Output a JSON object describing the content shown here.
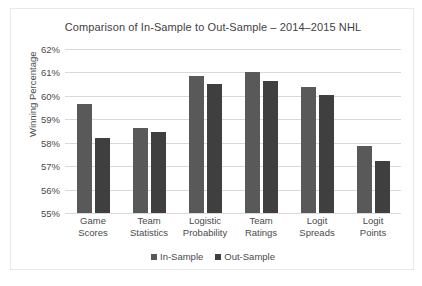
{
  "chart_data": {
    "type": "bar",
    "title": "Comparison of In-Sample to Out-Sample – 2014–2015 NHL",
    "xlabel": "",
    "ylabel": "Winning Percentage",
    "ylim": [
      55,
      62
    ],
    "ytick_values": [
      62,
      61,
      60,
      59,
      58,
      57,
      56,
      55
    ],
    "ytick_labels": [
      "62%",
      "61%",
      "60%",
      "59%",
      "58%",
      "57%",
      "56%",
      "55%"
    ],
    "grid": true,
    "legend_position": "bottom",
    "categories": [
      "Game Scores",
      "Team Statistics",
      "Logistic Probability",
      "Team Ratings",
      "Logit Spreads",
      "Logit Points"
    ],
    "category_lines": [
      [
        "Game",
        "Scores"
      ],
      [
        "Team",
        "Statistics"
      ],
      [
        "Logistic",
        "Probability"
      ],
      [
        "Team",
        "Ratings"
      ],
      [
        "Logit",
        "Spreads"
      ],
      [
        "Logit",
        "Points"
      ]
    ],
    "series": [
      {
        "name": "In-Sample",
        "color": "#595959",
        "values": [
          59.65,
          58.65,
          60.85,
          61.0,
          60.4,
          57.85
        ]
      },
      {
        "name": "Out-Sample",
        "color": "#3F3F3F",
        "values": [
          58.2,
          58.45,
          60.5,
          60.65,
          60.05,
          57.2
        ]
      }
    ]
  },
  "legend": {
    "items": [
      {
        "label": "In-Sample"
      },
      {
        "label": "Out-Sample"
      }
    ]
  }
}
